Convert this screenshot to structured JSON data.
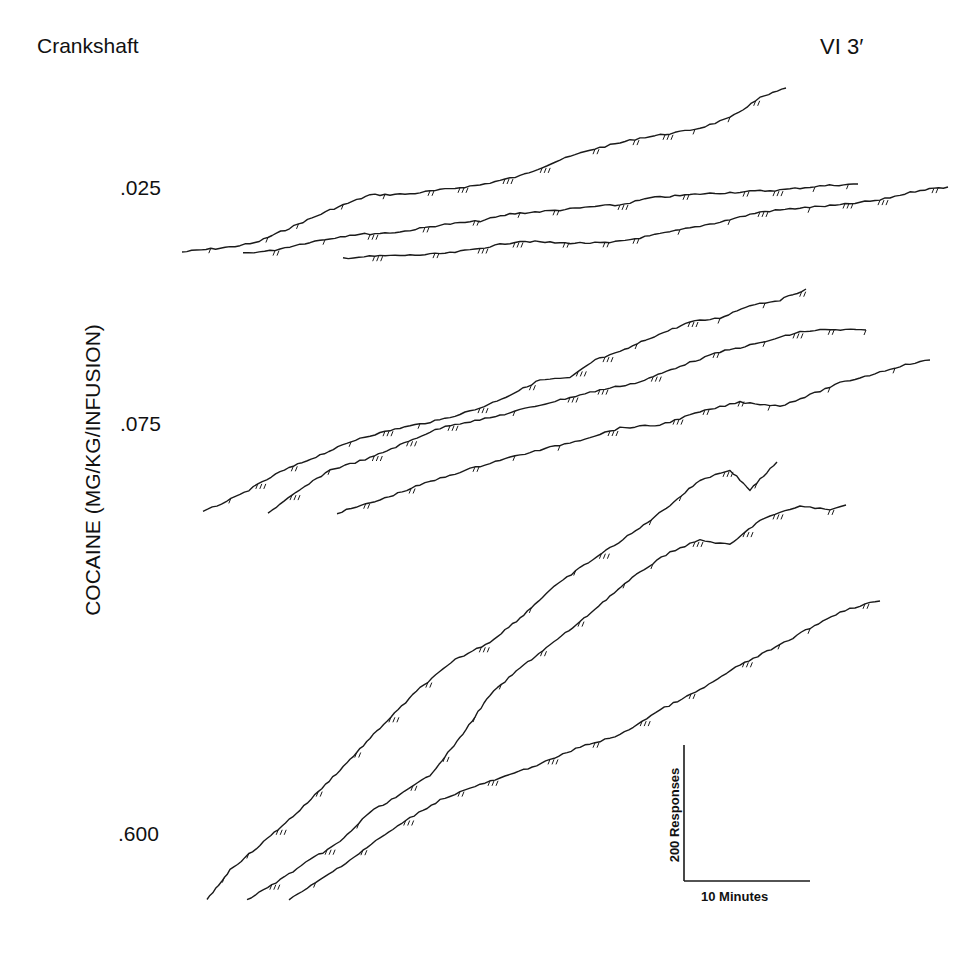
{
  "title": {
    "subject": "Crankshaft",
    "schedule": "VI 3′"
  },
  "axis": {
    "ylabel": "COCAINE (MG/KG/INFUSION)"
  },
  "doses": [
    {
      "label": ".025",
      "x": 120,
      "y": 176
    },
    {
      "label": ".075",
      "x": 120,
      "y": 412
    },
    {
      "label": ".600",
      "x": 118,
      "y": 822
    }
  ],
  "scale_bar": {
    "vertical_label": "200 Responses",
    "horizontal_label": "10 Minutes"
  },
  "colors": {
    "ink": "#1a1a1a",
    "background": "#ffffff"
  },
  "chart_data": {
    "type": "line",
    "xlabel": "Time (scale bar: 10 Minutes)",
    "ylabel": "COCAINE (MG/KG/INFUSION)",
    "grid": false,
    "legend": "none",
    "groups": [
      {
        "dose": ".025",
        "series": [
          {
            "name": ".025 session 1",
            "points": [
              [
                182,
                252
              ],
              [
                230,
                247
              ],
              [
                255,
                243
              ],
              [
                285,
                230
              ],
              [
                330,
                210
              ],
              [
                370,
                195
              ],
              [
                410,
                194
              ],
              [
                440,
                190
              ],
              [
                480,
                185
              ],
              [
                520,
                176
              ],
              [
                560,
                160
              ],
              [
                590,
                150
              ],
              [
                640,
                138
              ],
              [
                680,
                132
              ],
              [
                700,
                128
              ],
              [
                730,
                118
              ],
              [
                760,
                98
              ],
              [
                786,
                88
              ]
            ]
          },
          {
            "name": ".025 session 2",
            "points": [
              [
                243,
                253
              ],
              [
                270,
                251
              ],
              [
                310,
                242
              ],
              [
                350,
                235
              ],
              [
                400,
                232
              ],
              [
                440,
                225
              ],
              [
                480,
                221
              ],
              [
                510,
                214
              ],
              [
                560,
                210
              ],
              [
                600,
                206
              ],
              [
                620,
                205
              ],
              [
                650,
                198
              ],
              [
                700,
                194
              ],
              [
                740,
                192
              ],
              [
                780,
                190
              ],
              [
                820,
                186
              ],
              [
                858,
                184
              ]
            ]
          },
          {
            "name": ".025 session 3",
            "points": [
              [
                343,
                258
              ],
              [
                380,
                256
              ],
              [
                420,
                255
              ],
              [
                450,
                253
              ],
              [
                470,
                250
              ],
              [
                520,
                241
              ],
              [
                560,
                243
              ],
              [
                610,
                243
              ],
              [
                650,
                236
              ],
              [
                690,
                228
              ],
              [
                720,
                222
              ],
              [
                760,
                212
              ],
              [
                800,
                208
              ],
              [
                840,
                205
              ],
              [
                880,
                200
              ],
              [
                920,
                190
              ],
              [
                948,
                187
              ]
            ]
          }
        ]
      },
      {
        "dose": ".075",
        "series": [
          {
            "name": ".075 session 1",
            "points": [
              [
                203,
                512
              ],
              [
                240,
                495
              ],
              [
                280,
                472
              ],
              [
                320,
                455
              ],
              [
                360,
                438
              ],
              [
                400,
                428
              ],
              [
                440,
                420
              ],
              [
                480,
                408
              ],
              [
                510,
                395
              ],
              [
                540,
                380
              ],
              [
                570,
                378
              ],
              [
                595,
                360
              ],
              [
                620,
                352
              ],
              [
                650,
                338
              ],
              [
                690,
                322
              ],
              [
                720,
                318
              ],
              [
                750,
                305
              ],
              [
                780,
                300
              ],
              [
                806,
                289
              ]
            ]
          },
          {
            "name": ".075 session 2",
            "points": [
              [
                268,
                513
              ],
              [
                300,
                490
              ],
              [
                330,
                470
              ],
              [
                370,
                458
              ],
              [
                400,
                445
              ],
              [
                430,
                432
              ],
              [
                450,
                425
              ],
              [
                490,
                418
              ],
              [
                520,
                410
              ],
              [
                560,
                400
              ],
              [
                600,
                390
              ],
              [
                640,
                382
              ],
              [
                680,
                366
              ],
              [
                720,
                352
              ],
              [
                760,
                343
              ],
              [
                800,
                332
              ],
              [
                820,
                330
              ],
              [
                866,
                330
              ]
            ]
          },
          {
            "name": ".075 session 3",
            "points": [
              [
                337,
                513
              ],
              [
                380,
                500
              ],
              [
                420,
                485
              ],
              [
                460,
                472
              ],
              [
                500,
                460
              ],
              [
                540,
                450
              ],
              [
                580,
                440
              ],
              [
                620,
                428
              ],
              [
                660,
                425
              ],
              [
                700,
                412
              ],
              [
                740,
                402
              ],
              [
                780,
                406
              ],
              [
                810,
                395
              ],
              [
                840,
                383
              ],
              [
                870,
                375
              ],
              [
                900,
                366
              ],
              [
                930,
                360
              ]
            ]
          }
        ]
      },
      {
        "dose": ".600",
        "series": [
          {
            "name": ".600 session 1",
            "points": [
              [
                207,
                900
              ],
              [
                230,
                870
              ],
              [
                260,
                845
              ],
              [
                300,
                810
              ],
              [
                340,
                770
              ],
              [
                380,
                728
              ],
              [
                420,
                688
              ],
              [
                455,
                660
              ],
              [
                490,
                642
              ],
              [
                520,
                618
              ],
              [
                550,
                590
              ],
              [
                580,
                568
              ],
              [
                610,
                548
              ],
              [
                640,
                528
              ],
              [
                670,
                505
              ],
              [
                700,
                480
              ],
              [
                730,
                470
              ],
              [
                750,
                490
              ],
              [
                777,
                462
              ]
            ]
          },
          {
            "name": ".600 session 2",
            "points": [
              [
                247,
                900
              ],
              [
                280,
                880
              ],
              [
                310,
                860
              ],
              [
                340,
                842
              ],
              [
                370,
                812
              ],
              [
                400,
                795
              ],
              [
                430,
                775
              ],
              [
                460,
                738
              ],
              [
                490,
                695
              ],
              [
                520,
                668
              ],
              [
                550,
                645
              ],
              [
                580,
                622
              ],
              [
                610,
                596
              ],
              [
                640,
                572
              ],
              [
                670,
                552
              ],
              [
                700,
                540
              ],
              [
                730,
                545
              ],
              [
                760,
                520
              ],
              [
                800,
                506
              ],
              [
                830,
                510
              ],
              [
                846,
                505
              ]
            ]
          },
          {
            "name": ".600 session 3",
            "points": [
              [
                289,
                900
              ],
              [
                320,
                880
              ],
              [
                350,
                860
              ],
              [
                380,
                838
              ],
              [
                410,
                818
              ],
              [
                440,
                800
              ],
              [
                470,
                788
              ],
              [
                510,
                775
              ],
              [
                550,
                760
              ],
              [
                580,
                747
              ],
              [
                620,
                735
              ],
              [
                660,
                710
              ],
              [
                700,
                690
              ],
              [
                740,
                665
              ],
              [
                780,
                645
              ],
              [
                810,
                628
              ],
              [
                840,
                612
              ],
              [
                865,
                604
              ],
              [
                880,
                601
              ]
            ]
          }
        ]
      }
    ]
  }
}
